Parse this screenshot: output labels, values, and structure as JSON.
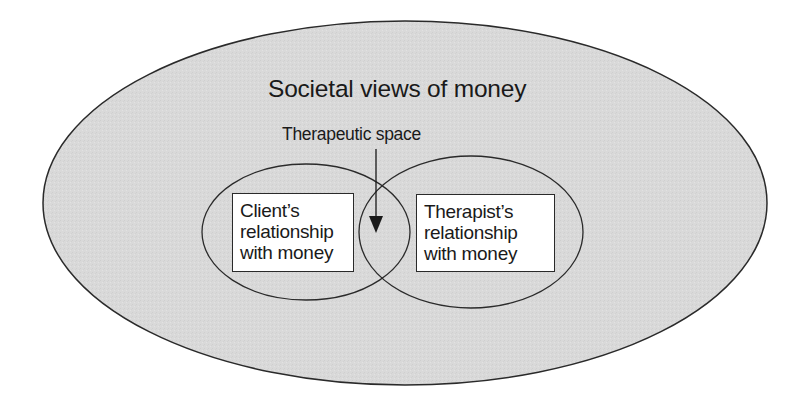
{
  "diagram": {
    "title": "Societal views of money",
    "pointer_label": "Therapeutic space",
    "left_circle": {
      "label_lines": [
        "Client’s",
        "relationship",
        "with money"
      ]
    },
    "right_circle": {
      "label_lines": [
        "Therapist’s",
        "relationship",
        "with money"
      ]
    },
    "colors": {
      "outer_fill": "#d9d9d9",
      "stroke": "#2a2a2a",
      "box_fill": "#ffffff",
      "text": "#1a1a1a",
      "background": "#ffffff"
    },
    "shapes": {
      "outer_ellipse": {
        "cx": 405,
        "cy": 203,
        "rx": 362,
        "ry": 182
      },
      "left_ellipse": {
        "cx": 306,
        "cy": 232,
        "rx": 104,
        "ry": 68
      },
      "right_ellipse": {
        "cx": 471,
        "cy": 232,
        "rx": 112,
        "ry": 76
      },
      "arrow": {
        "x": 376,
        "y1": 149,
        "y2": 232
      }
    }
  }
}
